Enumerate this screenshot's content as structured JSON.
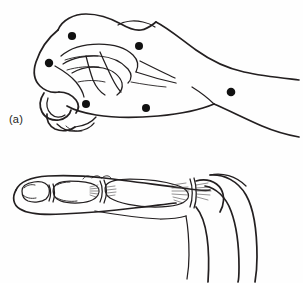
{
  "figure": {
    "type": "anatomical-line-drawing",
    "background_color": "#fefefe",
    "ink_color": "#231f20",
    "marker_color": "#111111",
    "width": 303,
    "height": 283
  },
  "panels": [
    {
      "id": "a",
      "caption": "(a)",
      "title": "Clenched fist, dorsal-radial view with marked sites",
      "view": "dorsal oblique of closed fist",
      "marker_count": 6,
      "markers": [
        {
          "name": "marker-1",
          "label": "",
          "x": 72,
          "y": 36,
          "r": 4.1
        },
        {
          "name": "marker-2",
          "label": "",
          "x": 139,
          "y": 46,
          "r": 4.0
        },
        {
          "name": "marker-3",
          "label": "",
          "x": 49,
          "y": 63,
          "r": 4.2
        },
        {
          "name": "marker-4",
          "label": "",
          "x": 231,
          "y": 92,
          "r": 4.3
        },
        {
          "name": "marker-5",
          "label": "",
          "x": 86,
          "y": 104,
          "r": 4.0
        },
        {
          "name": "marker-6",
          "label": "",
          "x": 146,
          "y": 108,
          "r": 4.0
        }
      ]
    },
    {
      "id": "b",
      "caption": "(b)",
      "title": "Finger in lateral view showing phalanges and joint capsules",
      "view": "lateral / sagittal of extended digit",
      "marker_count": 0,
      "markers": []
    }
  ],
  "labels": {
    "caption_a": "(a)",
    "caption_b": "(b)"
  }
}
